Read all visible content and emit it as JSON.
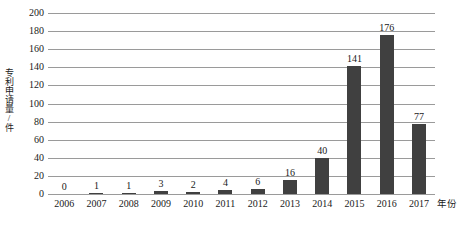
{
  "chart_data": {
    "type": "bar",
    "title": "",
    "xlabel": "年份",
    "ylabel": "专利申请量/件",
    "categories": [
      "2006",
      "2007",
      "2008",
      "2009",
      "2010",
      "2011",
      "2012",
      "2013",
      "2014",
      "2015",
      "2016",
      "2017"
    ],
    "values": [
      0,
      1,
      1,
      3,
      2,
      4,
      6,
      16,
      40,
      141,
      176,
      77
    ],
    "data_labels": [
      "0",
      "1",
      "1",
      "3",
      "2",
      "4",
      "6",
      "16",
      "40",
      "141",
      "176",
      "77"
    ],
    "ylim": [
      0,
      200
    ],
    "ytick_values": [
      0,
      20,
      40,
      60,
      80,
      100,
      120,
      140,
      160,
      180,
      200
    ],
    "ytick_labels": [
      "0",
      "20",
      "40",
      "60",
      "80",
      "100",
      "120",
      "140",
      "160",
      "180",
      "200"
    ],
    "grid": true,
    "legend": false,
    "bar_color": "#404040",
    "grid_color": "#9a9a9a",
    "axis_color": "#9a9a9a",
    "background": "#ffffff"
  }
}
